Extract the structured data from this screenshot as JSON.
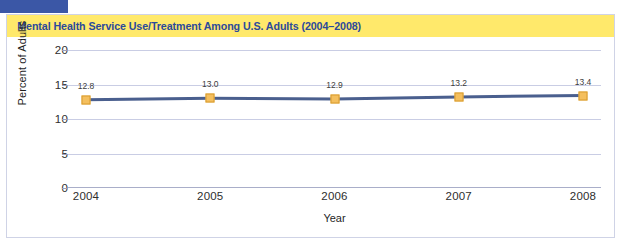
{
  "figure": {
    "title": "Mental Health Service Use/Treatment Among U.S. Adults (2004–2008)",
    "title_background_color": "#FFE96B",
    "title_text_color": "#2B4A9B",
    "corner_block_color": "#3B57A6"
  },
  "chart_data": {
    "type": "line",
    "title": "Mental Health Service Use/Treatment Among U.S. Adults (2004–2008)",
    "categories": [
      "2004",
      "2005",
      "2006",
      "2007",
      "2008"
    ],
    "values": [
      12.8,
      13.0,
      12.9,
      13.2,
      13.4
    ],
    "point_labels": [
      "12.8",
      "13.0",
      "12.9",
      "13.2",
      "13.4"
    ],
    "xlabel": "Year",
    "ylabel": "Percent of Adults",
    "ylim": [
      0,
      20
    ],
    "yticks": [
      0,
      5,
      10,
      15,
      20
    ],
    "ytick_labels": [
      "0",
      "5",
      "10",
      "15",
      "20"
    ],
    "grid": "horizontal",
    "legend": "none",
    "line_color": "#4A5F8E",
    "marker_color": "#F4BF5E",
    "marker_edge_color": "#D89B2F",
    "gridline_color": "#C9CDE4"
  }
}
